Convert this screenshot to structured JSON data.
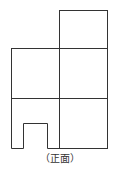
{
  "figure": {
    "caption": "（正面）",
    "stroke_color": "#333333",
    "grid": {
      "rows_from_top": [
        {
          "row": 1,
          "cells": [
            "",
            "cube"
          ]
        },
        {
          "row": 2,
          "cells": [
            "cube",
            "cube"
          ]
        },
        {
          "row": 3,
          "cells": [
            "cube-with-notch",
            "cube"
          ]
        }
      ]
    }
  }
}
